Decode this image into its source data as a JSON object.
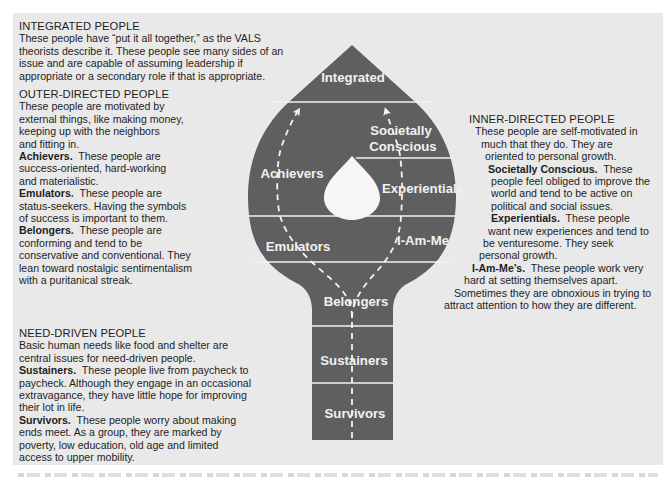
{
  "left_column": {
    "integrated": {
      "heading": "INTEGRATED PEOPLE",
      "lines": [
        "These people have “put it all together,” as the VALS",
        "theorists describe it. These people see many sides of an",
        "issue and are capable of assuming leadership if",
        "appropriate or a secondary role if that is appropriate."
      ]
    },
    "outer_directed": {
      "heading": "OUTER-DIRECTED PEOPLE",
      "lines": [
        "These people are motivated by",
        "external things, like making money,",
        "keeping up with the neighbors",
        "and fitting in."
      ],
      "achievers": {
        "term": "Achievers.",
        "lines": [
          "  These people are",
          "success-oriented, hard-working",
          "and materialistic."
        ]
      },
      "emulators": {
        "term": "Emulators.",
        "lines": [
          "  These people are",
          "status-seekers. Having the symbols",
          "of success is important to them."
        ]
      },
      "belongers": {
        "term": "Belongers.",
        "lines": [
          "  These people are",
          "conforming and tend to be",
          "conservative and conventional. They",
          "lean toward nostalgic sentimentalism",
          "with a puritanical streak."
        ]
      }
    },
    "need_driven": {
      "heading": "NEED-DRIVEN PEOPLE",
      "lines": [
        "Basic human needs like food and shelter are",
        "central issues for need-driven people."
      ],
      "sustainers": {
        "term": "Sustainers.",
        "lines": [
          "  These people live from paycheck to",
          "paycheck. Although they engage in an occasional",
          "extravagance, they have little hope for improving",
          "their lot in life."
        ]
      },
      "survivors": {
        "term": "Survivors.",
        "lines": [
          "  These people worry about making",
          "ends meet. As a group, they are marked by",
          "poverty, low education, old age and limited",
          "access to upper mobility."
        ]
      }
    }
  },
  "right_column": {
    "inner_directed": {
      "heading": "INNER-DIRECTED PEOPLE",
      "lines": [
        "These people are self-motivated in",
        "much that they do. They are",
        "oriented to personal growth."
      ],
      "societally_conscious": {
        "term": "Societally Conscious.",
        "lines": [
          "  These",
          "people feel obliged to improve the",
          "world and tend to be active on",
          "political and social issues."
        ]
      },
      "experientials": {
        "term": "Experientials.",
        "lines": [
          "  These people",
          "want new experiences and tend to",
          "be venturesome. They seek",
          "personal growth."
        ]
      },
      "i_am_mes": {
        "term": "I-Am-Me’s.",
        "lines": [
          "  These people work very",
          "hard at setting themselves apart.",
          "Sometimes they are obnoxious in trying to",
          "attract attention to how they are different."
        ]
      }
    }
  },
  "diagram": {
    "fill_color": "#5f5f5f",
    "line_color": "#f2f2f2",
    "panel_color": "#e9e9e9",
    "segments": {
      "integrated": "Integrated",
      "achievers": "Achievers",
      "societally_l1": "Societally",
      "societally_l2": "Conscious",
      "experientials": "Experientials",
      "emulators": "Emulators",
      "i_am_me": "I-Am-Me",
      "belongers": "Belongers",
      "sustainers": "Sustainers",
      "survivors": "Survivors"
    }
  }
}
